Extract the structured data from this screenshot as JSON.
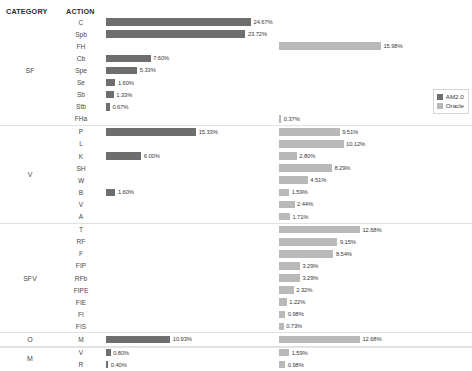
{
  "header": {
    "category_label": "CATEGORY",
    "action_label": "ACTION"
  },
  "legend": {
    "position": "right",
    "items": [
      {
        "label": "AM2.0",
        "color": "#6e6e6e"
      },
      {
        "label": "Oracle",
        "color": "#b9b9b9"
      }
    ]
  },
  "chart_data": {
    "type": "bar",
    "orientation": "horizontal",
    "title": "",
    "xlabel": "",
    "ylabel": "",
    "grid": false,
    "legend_position": "right",
    "series": [
      {
        "name": "AM2.0",
        "color": "#6e6e6e"
      },
      {
        "name": "Oracle",
        "color": "#b9b9b9"
      }
    ],
    "value_suffix": "%",
    "xlim": [
      0,
      25
    ],
    "groups": [
      {
        "category": "SF",
        "rows": [
          {
            "action": "C",
            "AM2.0": 24.67,
            "Oracle": null
          },
          {
            "action": "Spb",
            "AM2.0": 23.72,
            "Oracle": null
          },
          {
            "action": "FH",
            "AM2.0": null,
            "Oracle": 15.98
          },
          {
            "action": "Cb",
            "AM2.0": 7.6,
            "Oracle": null
          },
          {
            "action": "Spe",
            "AM2.0": 5.33,
            "Oracle": null
          },
          {
            "action": "Se",
            "AM2.0": 1.6,
            "Oracle": null
          },
          {
            "action": "Sb",
            "AM2.0": 1.33,
            "Oracle": null
          },
          {
            "action": "Stb",
            "AM2.0": 0.67,
            "Oracle": null
          },
          {
            "action": "FHa",
            "AM2.0": null,
            "Oracle": 0.37
          }
        ]
      },
      {
        "category": "V",
        "rows": [
          {
            "action": "P",
            "AM2.0": 15.33,
            "Oracle": 9.51
          },
          {
            "action": "L",
            "AM2.0": null,
            "Oracle": 10.12
          },
          {
            "action": "K",
            "AM2.0": 6.0,
            "Oracle": 2.8
          },
          {
            "action": "SH",
            "AM2.0": null,
            "Oracle": 8.29
          },
          {
            "action": "W",
            "AM2.0": null,
            "Oracle": 4.51
          },
          {
            "action": "B",
            "AM2.0": 1.6,
            "Oracle": 1.59
          },
          {
            "action": "V",
            "AM2.0": null,
            "Oracle": 2.44
          },
          {
            "action": "A",
            "AM2.0": null,
            "Oracle": 1.71
          }
        ]
      },
      {
        "category": "SFV",
        "rows": [
          {
            "action": "T",
            "AM2.0": null,
            "Oracle": 12.68
          },
          {
            "action": "RF",
            "AM2.0": null,
            "Oracle": 9.15
          },
          {
            "action": "F",
            "AM2.0": null,
            "Oracle": 8.54
          },
          {
            "action": "FIP",
            "AM2.0": null,
            "Oracle": 3.29
          },
          {
            "action": "RFb",
            "AM2.0": null,
            "Oracle": 3.29
          },
          {
            "action": "FIPE",
            "AM2.0": null,
            "Oracle": 2.32
          },
          {
            "action": "FIE",
            "AM2.0": null,
            "Oracle": 1.22
          },
          {
            "action": "FI",
            "AM2.0": null,
            "Oracle": 0.98
          },
          {
            "action": "FIS",
            "AM2.0": null,
            "Oracle": 0.73
          }
        ]
      },
      {
        "category": "O",
        "rows": [
          {
            "action": "M",
            "AM2.0": 10.93,
            "Oracle": 12.68
          }
        ]
      },
      {
        "category": "M",
        "rows": [
          {
            "action": "V",
            "AM2.0": 0.8,
            "Oracle": 1.59
          },
          {
            "action": "R",
            "AM2.0": 0.4,
            "Oracle": 0.98
          }
        ]
      }
    ]
  }
}
